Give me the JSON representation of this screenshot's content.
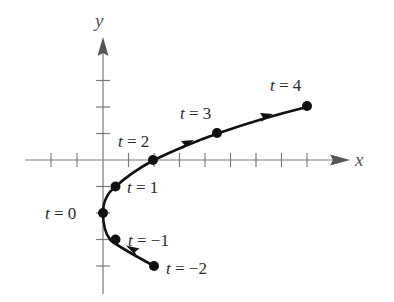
{
  "diagram": {
    "type": "parametric-curve",
    "axes": {
      "x_label": "x",
      "y_label": "y",
      "origin_px": [
        103,
        160
      ],
      "tick_spacing_px": [
        25.5,
        26.5
      ],
      "x_ticks": [
        -3,
        -2,
        -1,
        1,
        2,
        3,
        4,
        5,
        6,
        7,
        8
      ],
      "y_ticks": [
        -4,
        -3,
        -2,
        -1,
        1,
        2,
        3
      ],
      "axis_color": "#7a7a7a",
      "curve_color": "#111111"
    },
    "points": [
      {
        "t": -2,
        "label": "t = −2",
        "x": 2,
        "y": -4
      },
      {
        "t": -1,
        "label": "t = −1",
        "x": 0.5,
        "y": -3
      },
      {
        "t": 0,
        "label": "t = 0",
        "x": 0,
        "y": -2
      },
      {
        "t": 1,
        "label": "t = 1",
        "x": 0.5,
        "y": -1
      },
      {
        "t": 2,
        "label": "t = 2",
        "x": 2,
        "y": 0
      },
      {
        "t": 3,
        "label": "t = 3",
        "x": 4.5,
        "y": 1
      },
      {
        "t": 4,
        "label": "t = 4",
        "x": 8,
        "y": 2
      }
    ],
    "direction_arrows": [
      "between t=-2 and t=-1",
      "between t=2 and t=3",
      "between t=3 and t=4"
    ]
  },
  "labels": {
    "t_neg2": {
      "t": "t",
      "eq": " = −2"
    },
    "t_neg1": {
      "t": "t",
      "eq": " = −1"
    },
    "t_0": {
      "t": "t",
      "eq": " = 0"
    },
    "t_1": {
      "t": "t",
      "eq": " = 1"
    },
    "t_2": {
      "t": "t",
      "eq": " = 2"
    },
    "t_3": {
      "t": "t",
      "eq": " = 3"
    },
    "t_4": {
      "t": "t",
      "eq": " = 4"
    },
    "x_axis": "x",
    "y_axis": "y"
  }
}
